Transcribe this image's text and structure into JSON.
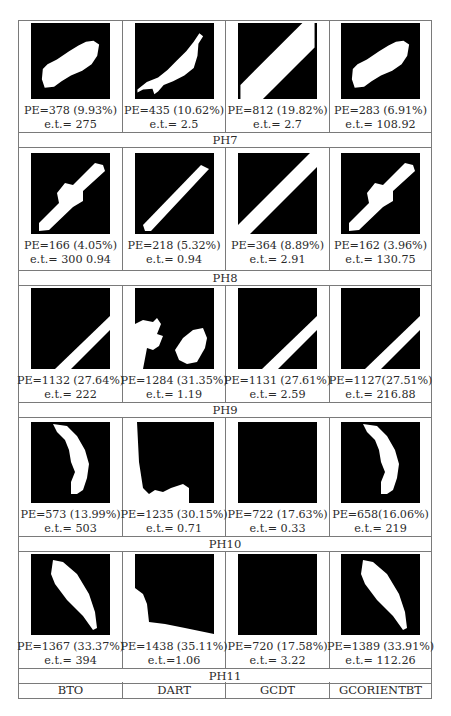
{
  "table": {
    "columns": [
      "BTO",
      "DART",
      "GCDT",
      "GCORIENTBT"
    ],
    "groups": [
      {
        "label": "PH7",
        "cells": [
          {
            "pe": "PE=378 (9.93%)",
            "et": "e.t.= 275",
            "image": "blob-tilted"
          },
          {
            "pe": "PE=435 (10.62%)",
            "et": "e.t.= 2.5",
            "image": "blob-jagged"
          },
          {
            "pe": "PE=812 (19.82%)",
            "et": "e.t.= 2.7",
            "image": "diagonal-band-wide"
          },
          {
            "pe": "PE=283 (6.91%)",
            "et": "e.t.= 108.92",
            "image": "blob-tilted"
          }
        ]
      },
      {
        "label": "PH8",
        "cells": [
          {
            "pe": "PE=166 (4.05%)",
            "et": "e.t.= 300 0.94",
            "image": "bar-with-bulge"
          },
          {
            "pe": "PE=218 (5.32%)",
            "et": "e.t.= 0.94",
            "image": "diagonal-bar"
          },
          {
            "pe": "PE=364 (8.89%)",
            "et": "e.t.= 2.91",
            "image": "diagonal-band-full"
          },
          {
            "pe": "PE=162 (3.96%)",
            "et": "e.t.= 130.75",
            "image": "bar-with-bulge"
          }
        ]
      },
      {
        "label": "PH9",
        "cells": [
          {
            "pe": "PE=1132 (27.64%)",
            "et": "e.t.= 222",
            "image": "corner-band"
          },
          {
            "pe": "PE=1284 (31.35%)",
            "et": "e.t.= 1.19",
            "image": "scattered-blobs"
          },
          {
            "pe": "PE=1131 (27.61%)",
            "et": "e.t.= 2.59",
            "image": "corner-band"
          },
          {
            "pe": "PE=1127(27.51%)",
            "et": "e.t.= 216.88",
            "image": "corner-band"
          }
        ]
      },
      {
        "label": "PH10",
        "cells": [
          {
            "pe": "PE=573 (13.99%)",
            "et": "e.t.= 503",
            "image": "curved-arc"
          },
          {
            "pe": "PE=1235 (30.15%)",
            "et": "e.t.= 0.71",
            "image": "left-bottom-fill"
          },
          {
            "pe": "PE=722 (17.63%)",
            "et": "e.t.= 0.33",
            "image": "empty"
          },
          {
            "pe": "PE=658(16.06%)",
            "et": "e.t.= 219",
            "image": "curved-arc"
          }
        ]
      },
      {
        "label": "PH11",
        "cells": [
          {
            "pe": "PE=1367 (33.37%)",
            "et": "e.t.= 394",
            "image": "leaf"
          },
          {
            "pe": "PE=1438 (35.11%)",
            "et": "e.t.=1.06",
            "image": "left-bottom-fill-2"
          },
          {
            "pe": "PE=720 (17.58%)",
            "et": "e.t.= 3.22",
            "image": "empty"
          },
          {
            "pe": "PE=1389 (33.91%)",
            "et": "e.t.= 112.26",
            "image": "leaf"
          }
        ]
      }
    ]
  }
}
